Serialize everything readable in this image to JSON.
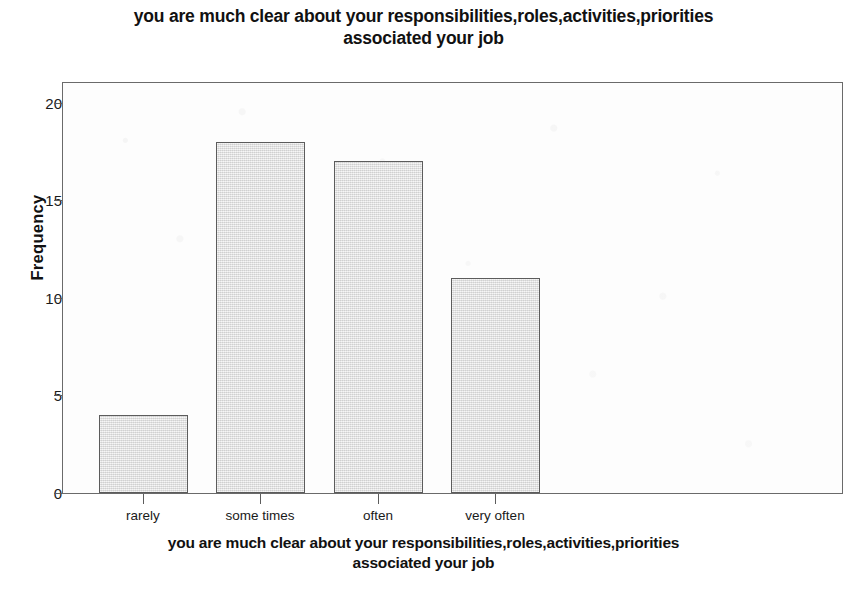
{
  "chart_data": {
    "type": "bar",
    "title": "you are much clear about your responsibilities,roles,activities,priorities associated your job",
    "title_lines": [
      "you are much clear about your responsibilities,roles,activities,priorities",
      "associated your job"
    ],
    "xlabel": "you are much clear about your responsibilities,roles,activities,priorities associated your job",
    "xlabel_lines": [
      "you are much clear about your responsibilities,roles,activities,priorities",
      "associated your job"
    ],
    "ylabel": "Frequency",
    "categories": [
      "rarely",
      "some times",
      "often",
      "very often"
    ],
    "values": [
      4,
      18,
      17,
      11
    ],
    "ylim": [
      0,
      21
    ],
    "y_ticks": [
      0,
      5,
      10,
      15,
      20
    ],
    "y_tick_labels": [
      "0",
      "5",
      "10",
      "15",
      "20"
    ],
    "grid": false,
    "legend": false,
    "bar_fill_color": "#e3e3e3",
    "bar_border_color": "#5c5c5c",
    "axis_color": "#6a6a6a",
    "background_color": "#ffffff"
  }
}
